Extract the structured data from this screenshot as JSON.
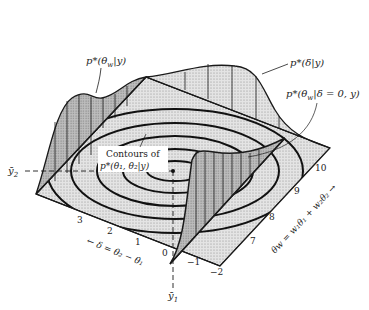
{
  "figure": {
    "axes": {
      "y_axis_label": "θ",
      "y_axis_sub": "2",
      "x_axis_label": "θ",
      "x_axis_sub": "1",
      "y_mean_label": "ȳ",
      "y_mean_sub": "2",
      "x_mean_label": "ȳ",
      "x_mean_sub": "1"
    },
    "annotations": {
      "marginal_w": "p*(θ",
      "marginal_w_sub": "w",
      "marginal_w_tail": "|y)",
      "marginal_delta": "p*(δ|y)",
      "conditional": "p*(θ",
      "conditional_sub": "w",
      "conditional_tail": "|δ = 0, y)",
      "contours_line1": "Contours of",
      "contours_line2": "p*(θ₁, θ₂|y)"
    },
    "delta_axis": {
      "label": "← δ = θ₂ − θ₁",
      "ticks": [
        "3",
        "2",
        "1",
        "0",
        "−1",
        "−2"
      ]
    },
    "w_axis": {
      "label": "θw = w₁θ₁ + w₂θ₂ →",
      "ticks": [
        "7",
        "8",
        "9",
        "10"
      ]
    },
    "colors": {
      "ink": "#1a1a1a",
      "plane_fill": "#dcdcdc",
      "curve_fill": "#a8a8a8",
      "background": "#ffffff"
    }
  }
}
